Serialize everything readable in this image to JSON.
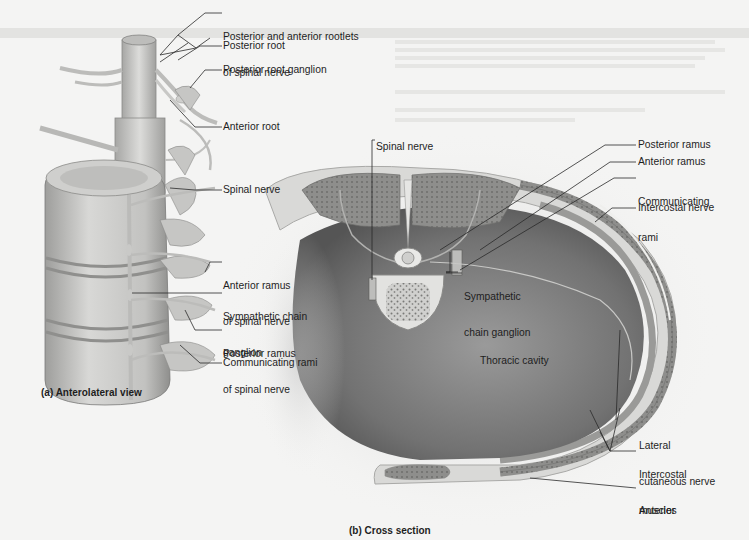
{
  "figure": {
    "panel_a": {
      "caption": "(a) Anterolateral view",
      "labels": {
        "rootlets_line1": "Posterior and anterior rootlets",
        "rootlets_line2": "of spinal nerve",
        "posterior_root": "Posterior root",
        "posterior_root_ganglion": "Posterior root ganglion",
        "anterior_root": "Anterior root",
        "spinal_nerve": "Spinal nerve",
        "anterior_ramus_line1": "Anterior ramus",
        "anterior_ramus_line2": "of spinal nerve",
        "sympathetic_chain_line1": "Sympathetic chain",
        "sympathetic_chain_line2": "ganglion",
        "posterior_ramus_line1": "Posterior ramus",
        "posterior_ramus_line2": "of spinal nerve",
        "communicating_rami": "Communicating rami"
      }
    },
    "panel_b": {
      "caption": "(b) Cross section",
      "labels": {
        "spinal_nerve": "Spinal nerve",
        "posterior_ramus": "Posterior ramus",
        "anterior_ramus": "Anterior ramus",
        "communicating_rami_line1": "Communicating",
        "communicating_rami_line2": "rami",
        "intercostal_nerve": "Intercostal nerve",
        "sympathetic_chain_ganglion_line1": "Sympathetic",
        "sympathetic_chain_ganglion_line2": "chain ganglion",
        "thoracic_cavity": "Thoracic cavity",
        "lateral_cutaneous_line1": "Lateral",
        "lateral_cutaneous_line2": "cutaneous nerve",
        "intercostal_muscles_line1": "Intercostal",
        "intercostal_muscles_line2": "muscles",
        "anterior_cutaneous_line1": "Anterior",
        "anterior_cutaneous_line2": "cutaneous nerve"
      }
    },
    "colors": {
      "page_bg": "#f4f4f3",
      "bone": "#d6d6d4",
      "nerve": "#c4c4c2",
      "cavity": "#7a7a7a",
      "muscle": "#8c8c8a",
      "leader_line": "#2a2a2a"
    }
  }
}
